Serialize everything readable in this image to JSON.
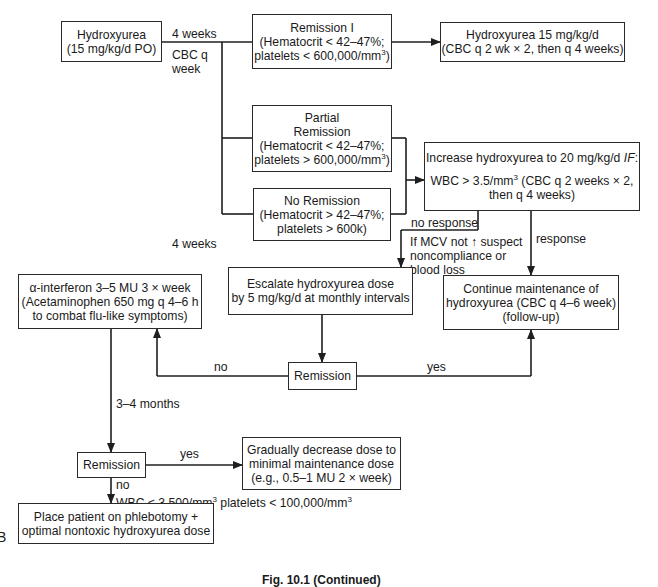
{
  "diagram": {
    "type": "clinical-treatment-flowchart",
    "panel_letter": "B",
    "caption": "Fig. 10.1 (Continued)",
    "nodes": {
      "start": {
        "lines": [
          "Hydroxyurea",
          "(15 mg/kg/d PO)"
        ]
      },
      "remission_1": {
        "lines": [
          "Remission I",
          "(Hematocrit < 42–47%;",
          "platelets < 600,000/mm3)"
        ]
      },
      "hydroxyurea_15": {
        "lines": [
          "Hydroxyurea 15 mg/kg/d",
          "(CBC q 2 wk × 2, then q 4 weeks)"
        ]
      },
      "partial_remission": {
        "lines": [
          "Partial",
          "Remission",
          "(Hematocrit < 42–47%;",
          "platelets > 600,000/mm3)"
        ]
      },
      "no_remission": {
        "lines": [
          "No Remission",
          "(Hematocrit > 42–47%;",
          "platelets > 600k)"
        ]
      },
      "increase_hydroxyurea": {
        "line1": "Increase hydroxyurea to 20 mg/kg/d",
        "line1_italic": "IF",
        "line1_end": ":",
        "line2": "WBC > 3.5/mm3 (CBC q 2 weeks × 2,",
        "line3": "then q 4 weeks)"
      },
      "interferon": {
        "lines": [
          "α-interferon 3–5 MU 3 × week",
          "(Acetaminophen 650 mg q 4–6 h",
          "to combat flu-like symptoms)"
        ]
      },
      "escalate": {
        "lines": [
          "Escalate hydroxyurea dose",
          "by 5 mg/kg/d at monthly intervals"
        ]
      },
      "continue_maintenance": {
        "lines": [
          "Continue maintenance of",
          "hydroxyurea (CBC q 4–6 week)",
          "(follow-up)"
        ]
      },
      "remission_mid": {
        "label": "Remission"
      },
      "remission_lower": {
        "label": "Remission"
      },
      "decrease_dose": {
        "lines": [
          "Gradually decrease dose to",
          "minimal maintenance dose",
          "(e.g., 0.5–1 MU 2 × week)"
        ]
      },
      "phlebotomy": {
        "lines": [
          "Place patient on phlebotomy +",
          "optimal nontoxic hydroxyurea dose"
        ]
      }
    },
    "edge_labels": {
      "four_weeks_top": "4 weeks",
      "cbc_q_week": [
        "CBC q",
        "week"
      ],
      "four_weeks_mid": "4 weeks",
      "no_response": "no response",
      "mcv_note": [
        "If MCV not ↑ suspect",
        "noncompliance or",
        "blood loss"
      ],
      "response": "response",
      "no_mid": "no",
      "yes_mid": "yes",
      "three_four_months": "3–4 months",
      "yes_lower": "yes",
      "no_lower": "no",
      "wbc_platelets": "WBC < 3,500/mm3 platelets < 100,000/mm3"
    },
    "colors": {
      "line": "#1f1f1f",
      "background": "#ffffff",
      "text": "#1a1a1a"
    }
  }
}
